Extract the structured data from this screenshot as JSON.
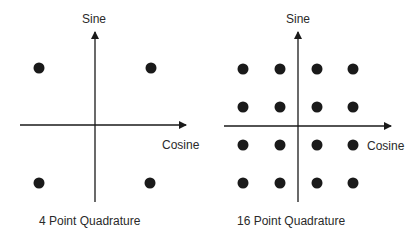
{
  "diagrams": [
    {
      "caption": "4 Point Quadrature",
      "y_axis_label": "Sine",
      "x_axis_label": "Cosine",
      "points": [
        [
          -1,
          1
        ],
        [
          1,
          1
        ],
        [
          -1,
          -1
        ],
        [
          1,
          -1
        ]
      ]
    },
    {
      "caption": "16 Point Quadrature",
      "y_axis_label": "Sine",
      "x_axis_label": "Cosine",
      "points": [
        [
          -3,
          3
        ],
        [
          -1,
          3
        ],
        [
          1,
          3
        ],
        [
          3,
          3
        ],
        [
          -3,
          1
        ],
        [
          -1,
          1
        ],
        [
          1,
          1
        ],
        [
          3,
          1
        ],
        [
          -3,
          -1
        ],
        [
          -1,
          -1
        ],
        [
          1,
          -1
        ],
        [
          3,
          -1
        ],
        [
          -3,
          -3
        ],
        [
          -1,
          -3
        ],
        [
          1,
          -3
        ],
        [
          3,
          -3
        ]
      ]
    }
  ],
  "colors": {
    "axis": "#1a1a1a",
    "dot": "#1a1a1a",
    "text": "#2a2a2a"
  }
}
